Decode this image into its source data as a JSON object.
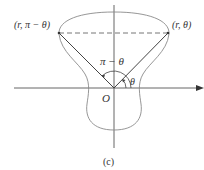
{
  "figure": {
    "caption": "(c)",
    "labels": {
      "left_point": "(r, π − θ)",
      "right_point": "(r, θ)",
      "supplementary_angle": "π − θ",
      "angle": "θ",
      "origin": "O"
    },
    "colors": {
      "curve": "#8a8a8a",
      "axes": "#555555",
      "rays": "#444444",
      "dashed_chord": "#666666",
      "text": "#333333"
    },
    "geometry": {
      "origin": [
        114,
        88
      ],
      "left_point": [
        59,
        33
      ],
      "right_point": [
        168,
        33
      ]
    }
  }
}
